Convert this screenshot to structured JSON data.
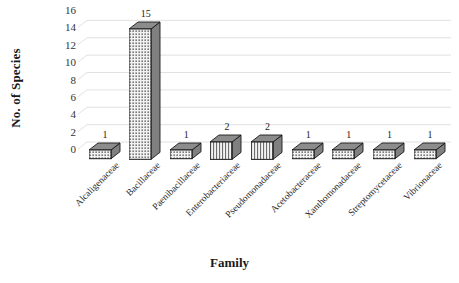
{
  "chart_data": {
    "type": "bar",
    "title": "",
    "xlabel": "Family",
    "ylabel": "No. of Species",
    "categories": [
      "Alcaligenaceae",
      "Bacillaceae",
      "Paenibacillaceae",
      "Enterobacteriaceae",
      "Pseudomonadaceae",
      "Acetobacteraceae",
      "Xanthomonadaceae",
      "Streptomycetaceae",
      "Vibrionaceae"
    ],
    "values": [
      1,
      15,
      1,
      2,
      2,
      1,
      1,
      1,
      1
    ],
    "data_labels": [
      "1",
      "15",
      "1",
      "2",
      "2",
      "1",
      "1",
      "1",
      "1"
    ],
    "ylim": [
      0,
      16
    ],
    "yticks": [
      0,
      2,
      4,
      6,
      8,
      10,
      12,
      14,
      16
    ],
    "ytick_labels": [
      "0",
      "2",
      "4",
      "6",
      "8",
      "10",
      "12",
      "14",
      "16"
    ],
    "grid": true,
    "legend": "none",
    "style": "3d-column",
    "colors": {
      "background": "#ffffff",
      "gridline": "#d9d9d9",
      "bar_front": "#f2f2f2",
      "bar_side": "#808080",
      "bar_top": "#8c8c8c",
      "bar_outline": "#1a1a1a",
      "text": "#1a1a1a"
    }
  }
}
